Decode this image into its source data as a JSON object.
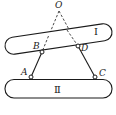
{
  "diagram": {
    "points": {
      "O": {
        "label": "O",
        "x": 59,
        "y": 11
      },
      "A": {
        "label": "A",
        "x": 31,
        "y": 77
      },
      "B": {
        "label": "B",
        "x": 42,
        "y": 52
      },
      "C": {
        "label": "C",
        "x": 95,
        "y": 77
      },
      "D": {
        "label": "D",
        "x": 78,
        "y": 46
      }
    },
    "bars": {
      "upper": {
        "label": "Ⅰ"
      },
      "lower": {
        "label": "Ⅱ"
      }
    },
    "colors": {
      "stroke": "#1a1a1a",
      "background": "#ffffff"
    }
  }
}
